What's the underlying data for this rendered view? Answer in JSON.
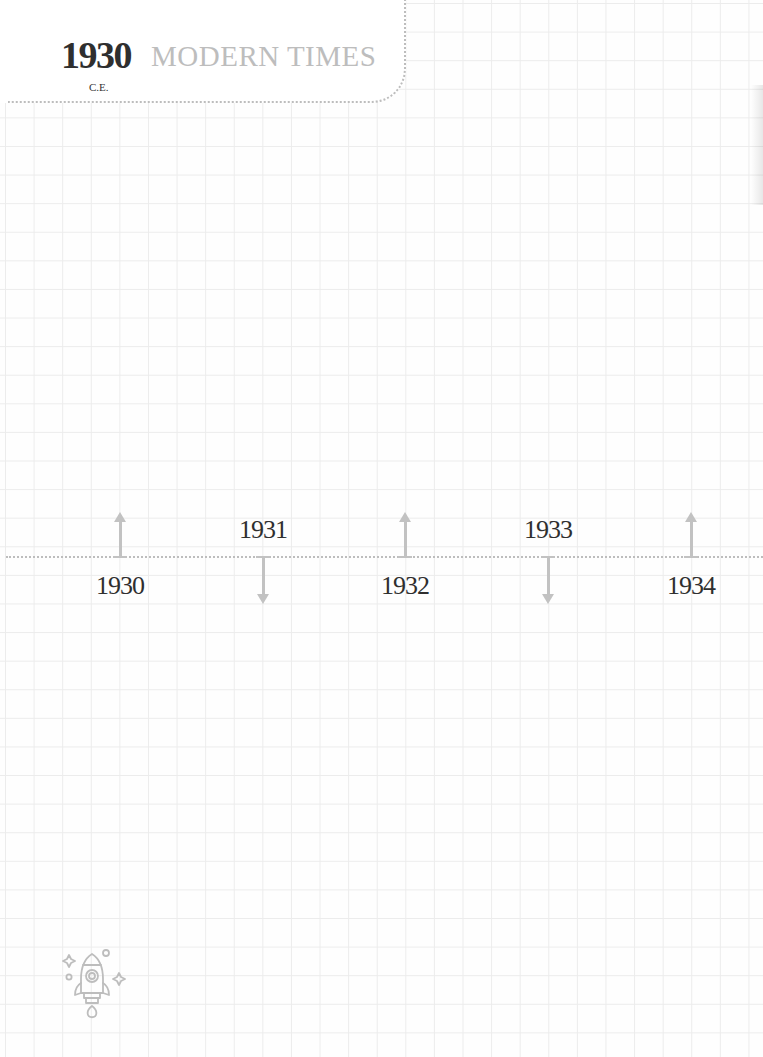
{
  "header": {
    "year": "1930",
    "era": "C.E.",
    "title": "MODERN TIMES"
  },
  "timeline": {
    "events": [
      {
        "year": "1930",
        "direction": "up",
        "label_position": "below",
        "x": 120
      },
      {
        "year": "1931",
        "direction": "down",
        "label_position": "above",
        "x": 263
      },
      {
        "year": "1932",
        "direction": "up",
        "label_position": "below",
        "x": 405
      },
      {
        "year": "1933",
        "direction": "down",
        "label_position": "above",
        "x": 548
      },
      {
        "year": "1934",
        "direction": "up",
        "label_position": "below",
        "x": 691
      }
    ]
  },
  "decoration": {
    "icon": "rocket-icon"
  },
  "colors": {
    "grid": "#ececec",
    "accent_gray": "#bdbdbd",
    "text_dark": "#2f2f2f"
  }
}
